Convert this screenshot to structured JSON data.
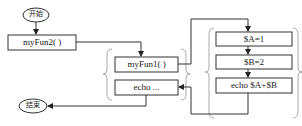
{
  "diagram": {
    "type": "flowchart",
    "start": {
      "label": "开始"
    },
    "end": {
      "label": "结束"
    },
    "main_calls": [
      {
        "label": "myFun2( )"
      }
    ],
    "myFun2_body": [
      {
        "label": "myFun1( )"
      },
      {
        "label": "echo ..."
      }
    ],
    "myFun1_body": [
      {
        "label": "$A=1"
      },
      {
        "label": "$B=2"
      },
      {
        "label": "echo $A+$B"
      }
    ],
    "colors": {
      "stroke": "#333333",
      "brace": "#aaaaaa",
      "background": "#ffffff"
    }
  }
}
